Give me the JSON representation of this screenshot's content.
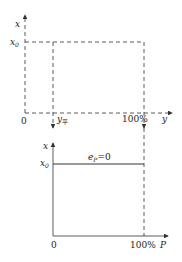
{
  "top_plot": {
    "y_axis_label": "x",
    "x_axis_label": "y",
    "origin_label": "0",
    "x0_label": "x",
    "x0_sub": "0",
    "y_balance_label": "y",
    "y_balance_sub": "平",
    "full_label": "100%"
  },
  "bottom_plot": {
    "y_axis_label": "x",
    "x_axis_label": "P",
    "origin_label": "0",
    "x0_label": "x",
    "x0_sub": "0",
    "line_label_e": "e",
    "line_label_sub": "P",
    "line_label_eq": "=0",
    "full_label": "100%"
  }
}
